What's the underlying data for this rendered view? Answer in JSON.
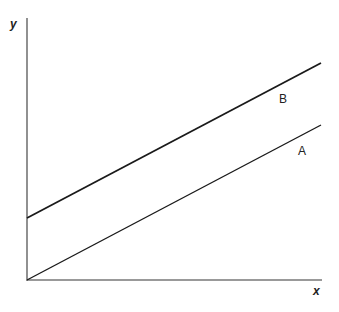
{
  "diagram": {
    "axes": {
      "x_label": "x",
      "y_label": "y"
    },
    "lines": [
      {
        "label": "B",
        "description": "upper parallel line with positive y-intercept"
      },
      {
        "label": "A",
        "description": "lower line through origin"
      }
    ],
    "colors": {
      "line": "#1a1a1a",
      "axis": "#555555",
      "background": "#ffffff"
    }
  }
}
